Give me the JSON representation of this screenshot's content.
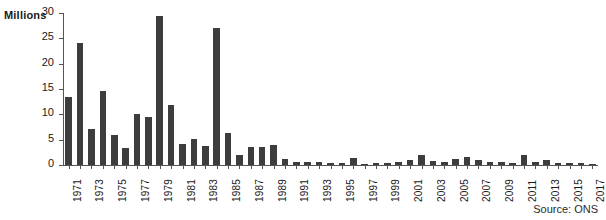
{
  "chart_data": {
    "type": "bar",
    "title": "",
    "subtitle": "",
    "xlabel": "",
    "ylabel": "Millions",
    "ylim": [
      0,
      30
    ],
    "yticks": [
      0,
      5,
      10,
      15,
      20,
      25,
      30
    ],
    "grid": false,
    "legend": null,
    "bar_color": "#3d3d3d",
    "axis_color": "#555555",
    "x_tick_label_interval": 2,
    "x_tick_labels_shown": [
      "1971",
      "1973",
      "1975",
      "1977",
      "1979",
      "1981",
      "1983",
      "1985",
      "1987",
      "1989",
      "1991",
      "1993",
      "1995",
      "1997",
      "1999",
      "2001",
      "2003",
      "2005",
      "2007",
      "2009",
      "2011",
      "2013",
      "2015",
      "2017"
    ],
    "categories": [
      "1971",
      "1972",
      "1973",
      "1974",
      "1975",
      "1976",
      "1977",
      "1978",
      "1979",
      "1980",
      "1981",
      "1982",
      "1983",
      "1984",
      "1985",
      "1986",
      "1987",
      "1988",
      "1989",
      "1990",
      "1991",
      "1992",
      "1993",
      "1994",
      "1995",
      "1996",
      "1997",
      "1998",
      "1999",
      "2000",
      "2001",
      "2002",
      "2003",
      "2004",
      "2005",
      "2006",
      "2007",
      "2008",
      "2009",
      "2010",
      "2011",
      "2012",
      "2013",
      "2014",
      "2015",
      "2016",
      "2017"
    ],
    "values": [
      13.5,
      24.0,
      7.2,
      14.7,
      5.9,
      3.3,
      10.1,
      9.4,
      29.5,
      11.9,
      4.2,
      5.2,
      3.7,
      27.1,
      6.3,
      1.9,
      3.5,
      3.6,
      4.0,
      1.1,
      0.6,
      0.5,
      0.5,
      0.4,
      0.3,
      1.3,
      0.2,
      0.3,
      0.3,
      0.6,
      0.9,
      1.9,
      0.8,
      0.5,
      1.1,
      1.5,
      0.9,
      0.6,
      0.5,
      0.4,
      2.0,
      0.5,
      0.9,
      0.3,
      0.4,
      0.3,
      0.2
    ]
  },
  "annotations": {
    "unit_label": "Millions",
    "source": "Source: ONS"
  }
}
